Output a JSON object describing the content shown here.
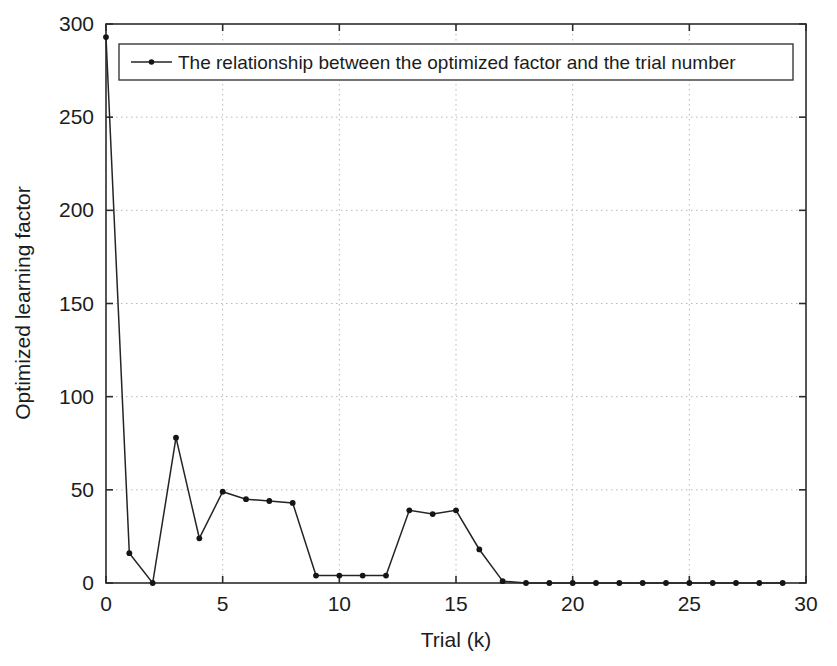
{
  "chart_data": {
    "type": "line",
    "title": "",
    "xlabel": "Trial (k)",
    "ylabel": "Optimized learning factor",
    "xlim": [
      0,
      30
    ],
    "ylim": [
      0,
      300
    ],
    "xticks": [
      0,
      5,
      10,
      15,
      20,
      25,
      30
    ],
    "yticks": [
      0,
      50,
      100,
      150,
      200,
      250,
      300
    ],
    "xtick_labels": [
      "0",
      "5",
      "10",
      "15",
      "20",
      "25",
      "30"
    ],
    "ytick_labels": [
      "0",
      "50",
      "100",
      "150",
      "200",
      "250",
      "300"
    ],
    "grid": true,
    "grid_style": "dotted",
    "legend_position": "top-center",
    "marker": "dot",
    "line_color": "#242424",
    "marker_color": "#151515",
    "grid_color": "#b9b9b9",
    "axis_color": "#2b2b2b",
    "series": [
      {
        "name": "The relationship between the optimized factor and the trial number",
        "x": [
          0,
          1,
          2,
          3,
          4,
          5,
          6,
          7,
          8,
          9,
          10,
          11,
          12,
          13,
          14,
          15,
          16,
          17,
          18,
          19,
          20,
          21,
          22,
          23,
          24,
          25,
          26,
          27,
          28,
          29
        ],
        "values": [
          293,
          16,
          0,
          78,
          24,
          49,
          45,
          44,
          43,
          4,
          4,
          4,
          4,
          39,
          37,
          39,
          18,
          1,
          0,
          0,
          0,
          0,
          0,
          0,
          0,
          0,
          0,
          0,
          0,
          0
        ]
      }
    ]
  },
  "legend": {
    "entry_label": "The relationship between the optimized factor and the trial number"
  },
  "axes": {
    "x_title": "Trial (k)",
    "y_title": "Optimized learning factor"
  }
}
